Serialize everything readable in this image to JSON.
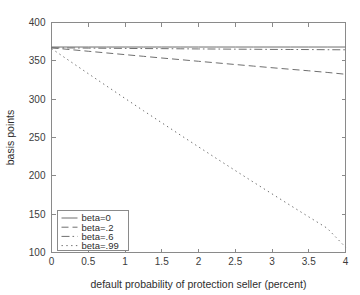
{
  "chart_data": {
    "type": "line",
    "title": "",
    "xlabel": "default probability of protection seller (percent)",
    "ylabel": "basis points",
    "xlim": [
      0,
      4
    ],
    "ylim": [
      100,
      400
    ],
    "xticks": [
      "0",
      "0.5",
      "1",
      "1.5",
      "2",
      "2.5",
      "3",
      "3.5",
      "4"
    ],
    "xtick_values": [
      0,
      0.5,
      1,
      1.5,
      2,
      2.5,
      3,
      3.5,
      4
    ],
    "yticks": [
      "100",
      "150",
      "200",
      "250",
      "300",
      "350",
      "400"
    ],
    "ytick_values": [
      100,
      150,
      200,
      250,
      300,
      350,
      400
    ],
    "grid": false,
    "legend_position": "lower-left",
    "x": [
      0,
      0.25,
      0.5,
      0.75,
      1,
      1.25,
      1.5,
      1.75,
      2,
      2.25,
      2.5,
      2.75,
      3,
      3.25,
      3.5,
      3.75,
      4
    ],
    "series": [
      {
        "name": "beta=0",
        "style": "solid",
        "dash": "none",
        "values": [
          368,
          368,
          368,
          368,
          368,
          368,
          368,
          368,
          368,
          368,
          368,
          368,
          368,
          368,
          368,
          368,
          368
        ]
      },
      {
        "name": "beta=.2",
        "style": "dashed",
        "dash": "7,4",
        "values": [
          367,
          364.7,
          362.5,
          360.3,
          358.1,
          355.9,
          353.7,
          351.6,
          349.4,
          347.3,
          345.2,
          343.1,
          341.0,
          339.0,
          337.0,
          334.9,
          332.5
        ]
      },
      {
        "name": "beta=.6",
        "style": "dash-dot",
        "dash": "8,3,1.6,3",
        "values": [
          367,
          366.8,
          366.6,
          366.4,
          366.2,
          366.0,
          365.9,
          365.7,
          365.5,
          365.4,
          365.2,
          365.1,
          364.9,
          364.8,
          364.7,
          364.5,
          364.4
        ]
      },
      {
        "name": "beta=.99",
        "style": "dotted",
        "dash": "1.4,3.4",
        "values": [
          366,
          349.6,
          333.3,
          317.1,
          301.0,
          285.0,
          269.2,
          253.4,
          237.8,
          222.3,
          206.9,
          191.6,
          176.5,
          161.4,
          146.5,
          131.7,
          107.0
        ]
      }
    ]
  },
  "legend": {
    "items": [
      {
        "label": "beta=0"
      },
      {
        "label": "beta=.2"
      },
      {
        "label": "beta=.6"
      },
      {
        "label": "beta=.99"
      }
    ]
  }
}
